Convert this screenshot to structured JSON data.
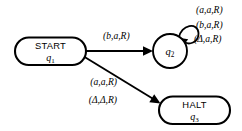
{
  "diagram": {
    "type": "state-transition-diagram",
    "title": "",
    "nodes": [
      {
        "id": "q1",
        "shape": "stadium",
        "title": "START",
        "state": "q",
        "state_subscript": "1",
        "cx": 50,
        "cy": 51
      },
      {
        "id": "q2",
        "shape": "circle",
        "title": "",
        "state": "q",
        "state_subscript": "2",
        "cx": 170,
        "cy": 51
      },
      {
        "id": "q3",
        "shape": "stadium",
        "title": "HALT",
        "state": "q",
        "state_subscript": "3",
        "cx": 194,
        "cy": 110
      }
    ],
    "edges": [
      {
        "id": "e1",
        "from": "q1",
        "to": "q2",
        "label": "(b,a,R)"
      },
      {
        "id": "e2",
        "from": "q1",
        "to": "q3",
        "labels": [
          "(a,a,R)",
          "(Δ,Δ,R)"
        ]
      },
      {
        "id": "e3",
        "from": "q2",
        "to": "q2",
        "kind": "self-loop",
        "labels": [
          "(a,a,R)",
          "(b,a,R)",
          "(Δ,a,R)"
        ]
      }
    ],
    "colors": {
      "stroke": "#000000",
      "fill": "#ffffff",
      "background": "#ffffff"
    }
  }
}
